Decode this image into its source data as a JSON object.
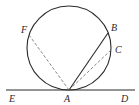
{
  "diagram": {
    "type": "geometry",
    "colors": {
      "stroke": "#2a2a2a",
      "dashed": "#666666",
      "background": "#ffffff"
    },
    "circle": {
      "cx": 69,
      "cy": 48,
      "r": 42
    },
    "tangent_line": {
      "x1": 6,
      "y1": 90,
      "x2": 135,
      "y2": 90
    },
    "points": {
      "A": {
        "x": 69,
        "y": 90
      },
      "B": {
        "x": 108,
        "y": 33
      },
      "C": {
        "x": 111,
        "y": 50
      },
      "F": {
        "x": 29,
        "y": 35
      }
    },
    "segments": [
      {
        "from": "A",
        "to": "B",
        "style": "solid"
      },
      {
        "from": "A",
        "to": "C",
        "style": "dashed"
      },
      {
        "from": "A",
        "to": "F",
        "style": "dashed"
      }
    ],
    "labels": {
      "F": "F",
      "B": "B",
      "C": "C",
      "E": "E",
      "A": "A",
      "D": "D"
    }
  }
}
